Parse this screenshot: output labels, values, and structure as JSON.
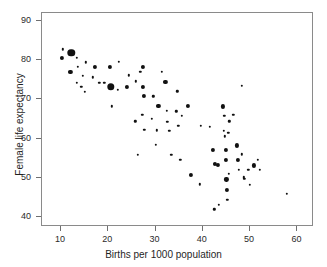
{
  "chart_data": {
    "type": "scatter",
    "title": "",
    "xlabel": "Births per 1000 population",
    "ylabel": "Female life expectancy",
    "xlim": [
      6,
      63.5
    ],
    "ylim": [
      37.5,
      92
    ],
    "xticks": [
      10,
      20,
      30,
      40,
      50,
      60
    ],
    "yticks": [
      40,
      50,
      60,
      70,
      80,
      90
    ],
    "grid": false,
    "legend": null,
    "marker_color": "#111111",
    "marker_sizes": {
      "small": 2.4,
      "medium": 4.2,
      "large": 7.4
    },
    "points": [
      {
        "x": 10.4,
        "y": 82.8,
        "size": "small"
      },
      {
        "x": 10.2,
        "y": 80.6,
        "size": "medium"
      },
      {
        "x": 12.2,
        "y": 81.8,
        "size": "large"
      },
      {
        "x": 13.3,
        "y": 80.6,
        "size": "small"
      },
      {
        "x": 12.0,
        "y": 77.0,
        "size": "medium"
      },
      {
        "x": 13.6,
        "y": 78.3,
        "size": "small"
      },
      {
        "x": 15.3,
        "y": 79.4,
        "size": "small"
      },
      {
        "x": 14.6,
        "y": 76.0,
        "size": "small"
      },
      {
        "x": 13.4,
        "y": 74.3,
        "size": "small"
      },
      {
        "x": 14.3,
        "y": 73.2,
        "size": "small"
      },
      {
        "x": 15.0,
        "y": 72.0,
        "size": "small"
      },
      {
        "x": 17.2,
        "y": 78.2,
        "size": "medium"
      },
      {
        "x": 16.8,
        "y": 75.6,
        "size": "small"
      },
      {
        "x": 18.1,
        "y": 74.3,
        "size": "small"
      },
      {
        "x": 19.2,
        "y": 74.2,
        "size": "small"
      },
      {
        "x": 20.6,
        "y": 73.2,
        "size": "large"
      },
      {
        "x": 20.3,
        "y": 78.2,
        "size": "medium"
      },
      {
        "x": 22.2,
        "y": 79.5,
        "size": "small"
      },
      {
        "x": 22.0,
        "y": 72.4,
        "size": "small"
      },
      {
        "x": 20.8,
        "y": 68.2,
        "size": "small"
      },
      {
        "x": 23.9,
        "y": 73.2,
        "size": "medium"
      },
      {
        "x": 24.4,
        "y": 76.1,
        "size": "small"
      },
      {
        "x": 25.8,
        "y": 74.6,
        "size": "small"
      },
      {
        "x": 25.7,
        "y": 64.4,
        "size": "small"
      },
      {
        "x": 26.3,
        "y": 55.9,
        "size": "small"
      },
      {
        "x": 27.4,
        "y": 78.2,
        "size": "medium"
      },
      {
        "x": 26.8,
        "y": 77.0,
        "size": "small"
      },
      {
        "x": 27.4,
        "y": 73.2,
        "size": "medium"
      },
      {
        "x": 27.5,
        "y": 70.8,
        "size": "medium"
      },
      {
        "x": 27.2,
        "y": 66.1,
        "size": "small"
      },
      {
        "x": 27.6,
        "y": 62.2,
        "size": "small"
      },
      {
        "x": 29.5,
        "y": 70.8,
        "size": "small"
      },
      {
        "x": 29.2,
        "y": 65.1,
        "size": "small"
      },
      {
        "x": 30.6,
        "y": 68.3,
        "size": "medium"
      },
      {
        "x": 30.3,
        "y": 62.1,
        "size": "small"
      },
      {
        "x": 30.1,
        "y": 58.5,
        "size": "small"
      },
      {
        "x": 31.3,
        "y": 77.0,
        "size": "small"
      },
      {
        "x": 32.1,
        "y": 74.5,
        "size": "medium"
      },
      {
        "x": 32.4,
        "y": 67.1,
        "size": "small"
      },
      {
        "x": 32.5,
        "y": 64.3,
        "size": "small"
      },
      {
        "x": 32.9,
        "y": 62.0,
        "size": "small"
      },
      {
        "x": 33.3,
        "y": 55.9,
        "size": "small"
      },
      {
        "x": 34.6,
        "y": 72.1,
        "size": "small"
      },
      {
        "x": 34.4,
        "y": 67.0,
        "size": "small"
      },
      {
        "x": 34.8,
        "y": 63.2,
        "size": "small"
      },
      {
        "x": 35.5,
        "y": 65.8,
        "size": "small"
      },
      {
        "x": 35.2,
        "y": 54.6,
        "size": "small"
      },
      {
        "x": 36.8,
        "y": 68.3,
        "size": "medium"
      },
      {
        "x": 37.4,
        "y": 50.8,
        "size": "medium"
      },
      {
        "x": 39.6,
        "y": 63.2,
        "size": "small"
      },
      {
        "x": 39.3,
        "y": 48.4,
        "size": "small"
      },
      {
        "x": 41.5,
        "y": 63.0,
        "size": "small"
      },
      {
        "x": 42.2,
        "y": 57.1,
        "size": "medium"
      },
      {
        "x": 42.6,
        "y": 53.6,
        "size": "medium"
      },
      {
        "x": 42.4,
        "y": 42.0,
        "size": "small"
      },
      {
        "x": 43.2,
        "y": 53.4,
        "size": "medium"
      },
      {
        "x": 43.4,
        "y": 43.2,
        "size": "small"
      },
      {
        "x": 44.2,
        "y": 68.2,
        "size": "medium"
      },
      {
        "x": 44.5,
        "y": 65.8,
        "size": "small"
      },
      {
        "x": 44.4,
        "y": 62.0,
        "size": "small"
      },
      {
        "x": 44.6,
        "y": 60.6,
        "size": "small"
      },
      {
        "x": 44.8,
        "y": 57.1,
        "size": "medium"
      },
      {
        "x": 44.9,
        "y": 54.5,
        "size": "medium"
      },
      {
        "x": 45.0,
        "y": 49.6,
        "size": "medium"
      },
      {
        "x": 45.1,
        "y": 47.0,
        "size": "medium"
      },
      {
        "x": 45.2,
        "y": 44.5,
        "size": "small"
      },
      {
        "x": 45.6,
        "y": 64.4,
        "size": "small"
      },
      {
        "x": 45.4,
        "y": 61.5,
        "size": "small"
      },
      {
        "x": 45.5,
        "y": 51.0,
        "size": "small"
      },
      {
        "x": 46.4,
        "y": 66.1,
        "size": "small"
      },
      {
        "x": 47.2,
        "y": 58.3,
        "size": "medium"
      },
      {
        "x": 47.4,
        "y": 54.5,
        "size": "medium"
      },
      {
        "x": 47.6,
        "y": 52.0,
        "size": "small"
      },
      {
        "x": 48.2,
        "y": 73.4,
        "size": "small"
      },
      {
        "x": 48.3,
        "y": 56.0,
        "size": "small"
      },
      {
        "x": 48.6,
        "y": 50.2,
        "size": "small"
      },
      {
        "x": 48.8,
        "y": 49.7,
        "size": "small"
      },
      {
        "x": 49.6,
        "y": 52.1,
        "size": "small"
      },
      {
        "x": 49.9,
        "y": 48.3,
        "size": "small"
      },
      {
        "x": 50.8,
        "y": 53.2,
        "size": "medium"
      },
      {
        "x": 51.6,
        "y": 54.6,
        "size": "small"
      },
      {
        "x": 52.0,
        "y": 52.0,
        "size": "small"
      },
      {
        "x": 57.8,
        "y": 45.9,
        "size": "small"
      }
    ]
  },
  "figure": {
    "top_artifact_text": ""
  }
}
